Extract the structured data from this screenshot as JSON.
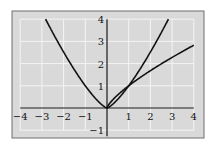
{
  "chart_data": {
    "type": "line",
    "title": "",
    "xlabel": "",
    "ylabel": "",
    "xlim": [
      -4,
      4
    ],
    "ylim": [
      -1,
      4
    ],
    "grid": true,
    "legend": null,
    "x_ticks": [
      "−4",
      "−3",
      "−2",
      "−1",
      "1",
      "2",
      "3",
      "4"
    ],
    "y_ticks": [
      "−1",
      "1",
      "2",
      "3",
      "4"
    ],
    "series": [
      {
        "name": "y = x^(4/3)",
        "x": [
          -2.83,
          -2,
          -1,
          0,
          1,
          2,
          2.83
        ],
        "y": [
          4,
          2.52,
          1,
          0,
          1,
          2.52,
          4
        ]
      },
      {
        "name": "y = x^(3/4)",
        "x": [
          0,
          1,
          2,
          3,
          4
        ],
        "y": [
          0,
          1,
          1.68,
          2.28,
          2.83
        ]
      }
    ],
    "colors": {
      "panel": "#d9d9d9",
      "grid": "#f4f4f4",
      "curve": "#111111",
      "border": "#6e6e6e"
    }
  }
}
